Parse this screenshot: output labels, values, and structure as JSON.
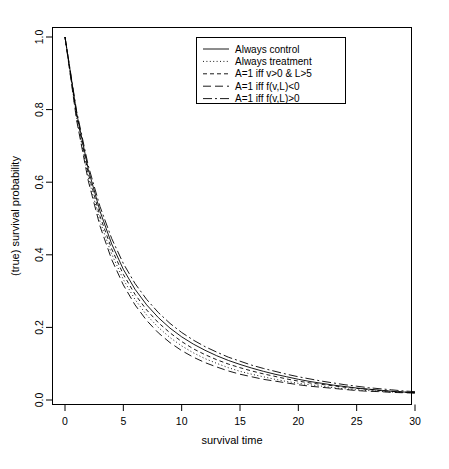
{
  "chart_data": {
    "type": "line",
    "title": "",
    "xlabel": "survival time",
    "ylabel": "(true) survival probability",
    "xlim": [
      0,
      30
    ],
    "ylim": [
      0,
      1.0
    ],
    "xticks": [
      0,
      5,
      10,
      15,
      20,
      25,
      30
    ],
    "xtick_labels": [
      "0",
      "5",
      "10",
      "15",
      "20",
      "25",
      "30"
    ],
    "yticks": [
      0.0,
      0.2,
      0.4,
      0.6,
      0.8,
      1.0
    ],
    "ytick_labels": [
      "0.0",
      "0.2",
      "0.4",
      "0.6",
      "0.8",
      "1.0"
    ],
    "grid": false,
    "legend_position": "top-center",
    "x": [
      0,
      1,
      2,
      3,
      4,
      5,
      6,
      7,
      8,
      9,
      10,
      11,
      12,
      13,
      14,
      15,
      16,
      17,
      18,
      19,
      20,
      21,
      22,
      23,
      24,
      25,
      26,
      27,
      28,
      29,
      30
    ],
    "series": [
      {
        "name": "Always control",
        "dash": "solid",
        "values": [
          1.0,
          0.79,
          0.635,
          0.52,
          0.43,
          0.36,
          0.305,
          0.262,
          0.227,
          0.198,
          0.174,
          0.154,
          0.137,
          0.122,
          0.109,
          0.098,
          0.088,
          0.079,
          0.071,
          0.064,
          0.057,
          0.051,
          0.046,
          0.041,
          0.037,
          0.033,
          0.03,
          0.027,
          0.024,
          0.022,
          0.02
        ]
      },
      {
        "name": "Always treatment",
        "dash": "dotted",
        "values": [
          1.0,
          0.775,
          0.612,
          0.492,
          0.402,
          0.332,
          0.277,
          0.234,
          0.2,
          0.172,
          0.149,
          0.13,
          0.114,
          0.101,
          0.089,
          0.079,
          0.071,
          0.064,
          0.057,
          0.051,
          0.046,
          0.042,
          0.038,
          0.034,
          0.031,
          0.028,
          0.026,
          0.024,
          0.022,
          0.021,
          0.02
        ]
      },
      {
        "name": "A=1 iff v>0 & L>5",
        "dash": "dashed",
        "values": [
          1.0,
          0.783,
          0.624,
          0.506,
          0.416,
          0.346,
          0.291,
          0.248,
          0.213,
          0.185,
          0.161,
          0.141,
          0.125,
          0.111,
          0.099,
          0.089,
          0.08,
          0.072,
          0.065,
          0.058,
          0.052,
          0.047,
          0.043,
          0.039,
          0.035,
          0.032,
          0.029,
          0.026,
          0.024,
          0.022,
          0.02
        ]
      },
      {
        "name": "A=1 iff f(v,L)<0",
        "dash": "longdash",
        "values": [
          1.0,
          0.77,
          0.603,
          0.479,
          0.387,
          0.317,
          0.262,
          0.219,
          0.185,
          0.158,
          0.136,
          0.118,
          0.103,
          0.091,
          0.08,
          0.071,
          0.064,
          0.057,
          0.052,
          0.047,
          0.042,
          0.038,
          0.035,
          0.032,
          0.029,
          0.026,
          0.024,
          0.023,
          0.021,
          0.02,
          0.019
        ]
      },
      {
        "name": "A=1 iff f(v,L)>0",
        "dash": "dashdot",
        "values": [
          1.0,
          0.795,
          0.645,
          0.533,
          0.445,
          0.376,
          0.321,
          0.277,
          0.241,
          0.211,
          0.186,
          0.165,
          0.147,
          0.132,
          0.118,
          0.107,
          0.096,
          0.087,
          0.079,
          0.071,
          0.064,
          0.058,
          0.052,
          0.047,
          0.042,
          0.038,
          0.034,
          0.031,
          0.028,
          0.025,
          0.023
        ]
      }
    ]
  },
  "legend": {
    "items": [
      {
        "label": "Always control"
      },
      {
        "label": "Always treatment"
      },
      {
        "label": "A=1 iff v>0 & L>5"
      },
      {
        "label": "A=1 iff f(v,L)<0"
      },
      {
        "label": "A=1 iff f(v,L)>0"
      }
    ]
  }
}
